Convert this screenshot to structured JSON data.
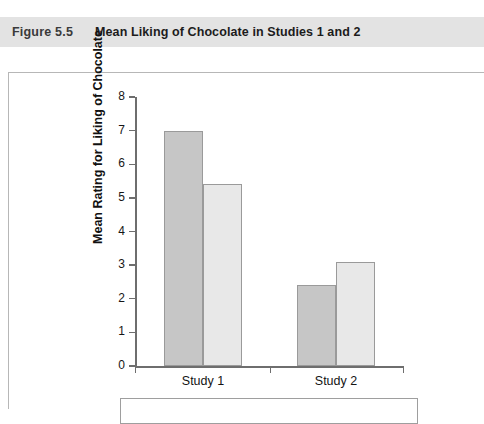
{
  "caption": {
    "number": "Figure 5.5",
    "title": "Mean Liking of Chocolate in Studies 1 and 2"
  },
  "chart_data": {
    "type": "bar",
    "title": "Mean Liking of Chocolate in Studies 1 and 2",
    "xlabel": "",
    "ylabel": "Mean Rating for Liking of Chocolate",
    "categories": [
      "Study 1",
      "Study 2"
    ],
    "series": [
      {
        "name": "series-1",
        "color": "#c6c6c6",
        "values": [
          7.0,
          2.4
        ]
      },
      {
        "name": "series-2",
        "color": "#e8e8e8",
        "values": [
          5.4,
          3.1
        ]
      }
    ],
    "ylim": [
      0,
      8
    ],
    "yticks": [
      0,
      1,
      2,
      3,
      4,
      5,
      6,
      7,
      8
    ],
    "ytick_labels": [
      "0",
      "1",
      "2",
      "3",
      "4",
      "5",
      "6",
      "7",
      "8"
    ],
    "grid": false,
    "legend_position": "bottom"
  },
  "colors": {
    "caption_band": "#e3e3e3",
    "bar_dark": "#c6c6c6",
    "bar_light": "#e8e8e8",
    "bar_border": "#9a9a9a",
    "axis": "#6e6e6e"
  }
}
